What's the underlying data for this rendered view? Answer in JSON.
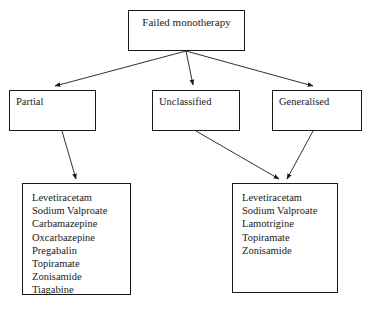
{
  "diagram": {
    "background_color": "#ffffff",
    "line_color": "#1a1a1a",
    "text_color": "#1a1a1a"
  },
  "nodes": {
    "root": {
      "label": "Failed monotherapy"
    },
    "partial": {
      "label": "Partial"
    },
    "unclassified": {
      "label": "Unclassified"
    },
    "generalised": {
      "label": "Generalised"
    },
    "list_partial": {
      "items": [
        "Levetiracetam",
        "Sodium Valproate",
        "Carbamazepine",
        "Oxcarbazepine",
        "Pregabalin",
        "Topiramate",
        "Zonisamide",
        "Tiagabine"
      ]
    },
    "list_generalised": {
      "items": [
        "Levetiracetam",
        "Sodium Valproate",
        "Lamotrigine",
        "Topiramate",
        "Zonisamide"
      ]
    }
  },
  "connectors": [
    {
      "name": "root-to-partial",
      "from": "root",
      "to": "partial"
    },
    {
      "name": "root-to-unclassified",
      "from": "root",
      "to": "unclassified"
    },
    {
      "name": "root-to-generalised",
      "from": "root",
      "to": "generalised"
    },
    {
      "name": "partial-to-list",
      "from": "partial",
      "to": "list_partial"
    },
    {
      "name": "unclassified-to-list",
      "from": "unclassified",
      "to": "list_generalised"
    },
    {
      "name": "generalised-to-list",
      "from": "generalised",
      "to": "list_generalised"
    }
  ]
}
